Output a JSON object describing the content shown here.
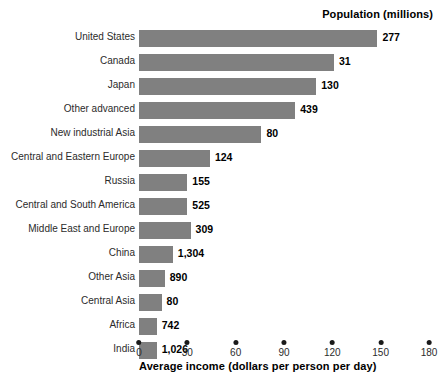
{
  "chart_data": {
    "type": "bar",
    "orientation": "horizontal",
    "title": "Population (millions)",
    "xlabel": "Average income (dollars per person per day)",
    "ylabel": "",
    "xlim": [
      0,
      180
    ],
    "xticks": [
      0,
      30,
      60,
      90,
      120,
      150,
      180
    ],
    "xtick_labels": [
      "0",
      "30",
      "60",
      "90",
      "120",
      "150",
      "180"
    ],
    "grid": false,
    "legend": "none",
    "bar_color": "#808080",
    "categories": [
      "United States",
      "Canada",
      "Japan",
      "Other advanced",
      "New industrial Asia",
      "Central and Eastern Europe",
      "Russia",
      "Central and South America",
      "Middle East and Europe",
      "China",
      "Other Asia",
      "Central Asia",
      "Africa",
      "India"
    ],
    "values": [
      148,
      121,
      110,
      97,
      76,
      44,
      30,
      30,
      32,
      21,
      16,
      14,
      11,
      11
    ],
    "value_labels": [
      "277",
      "31",
      "130",
      "439",
      "80",
      "124",
      "155",
      "525",
      "309",
      "1,304",
      "890",
      "80",
      "742",
      "1,026"
    ],
    "value_label_meaning": "Population (millions)",
    "rows": [
      {
        "category": "United States",
        "value": 148,
        "label": "277"
      },
      {
        "category": "Canada",
        "value": 121,
        "label": "31"
      },
      {
        "category": "Japan",
        "value": 110,
        "label": "130"
      },
      {
        "category": "Other advanced",
        "value": 97,
        "label": "439"
      },
      {
        "category": "New industrial Asia",
        "value": 76,
        "label": "80"
      },
      {
        "category": "Central and Eastern Europe",
        "value": 44,
        "label": "124"
      },
      {
        "category": "Russia",
        "value": 30,
        "label": "155"
      },
      {
        "category": "Central and South America",
        "value": 30,
        "label": "525"
      },
      {
        "category": "Middle East and Europe",
        "value": 32,
        "label": "309"
      },
      {
        "category": "China",
        "value": 21,
        "label": "1,304"
      },
      {
        "category": "Other Asia",
        "value": 16,
        "label": "890"
      },
      {
        "category": "Central Asia",
        "value": 14,
        "label": "80"
      },
      {
        "category": "Africa",
        "value": 11,
        "label": "742"
      },
      {
        "category": "India",
        "value": 11,
        "label": "1,026"
      }
    ]
  }
}
